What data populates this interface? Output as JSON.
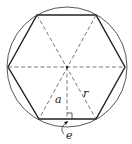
{
  "diagram": {
    "labels": {
      "apothem": "a",
      "radius": "r",
      "edge": "e"
    },
    "geometry": {
      "center": [
        67,
        67
      ],
      "circle_radius": 60,
      "vertices": [
        [
          8,
          67
        ],
        [
          37,
          15
        ],
        [
          96,
          15
        ],
        [
          125,
          67
        ],
        [
          96,
          119
        ],
        [
          39,
          119
        ]
      ]
    },
    "colors": {
      "stroke": "#333333",
      "background": "#ffffff"
    }
  }
}
